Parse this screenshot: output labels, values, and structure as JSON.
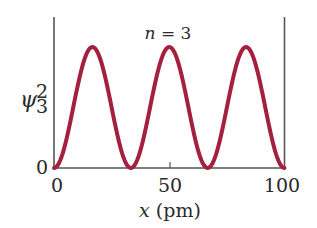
{
  "chart_data": {
    "type": "line",
    "title": "",
    "annotation": "n = 3",
    "annotation_var": "n",
    "annotation_rest": " = 3",
    "xlabel": "x (pm)",
    "xlabel_var": "x",
    "xlabel_unit": " (pm)",
    "ylabel": "ψ₃²",
    "ylabel_symbol": "ψ",
    "ylabel_sub": "3",
    "ylabel_sup": "2",
    "xlim": [
      0,
      100
    ],
    "ylim": [
      0,
      1.15
    ],
    "x_ticks": [
      "0",
      "50",
      "100"
    ],
    "y_ticks": [
      "0"
    ],
    "grid": false,
    "legend": null,
    "line_color": "#a3203f",
    "axis_color": "#555555",
    "series": [
      {
        "name": "probability density n=3",
        "function": "sin^2(3*pi*x/100)",
        "x": [
          0,
          5,
          10,
          16.67,
          25,
          33.33,
          40,
          50,
          60,
          66.67,
          75,
          83.33,
          90,
          95,
          100
        ],
        "values": [
          0,
          0.21,
          0.65,
          1.0,
          0.5,
          0,
          0.35,
          1.0,
          0.35,
          0,
          0.5,
          1.0,
          0.65,
          0.21,
          0
        ]
      }
    ]
  }
}
